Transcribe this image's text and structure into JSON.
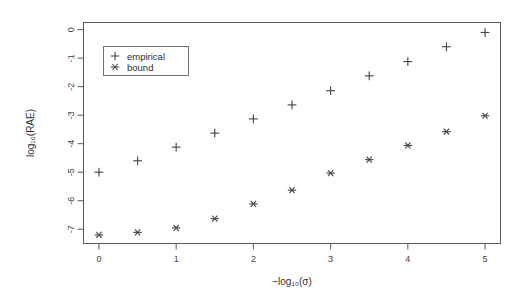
{
  "chart_data": {
    "type": "scatter",
    "title": "",
    "xlabel": "−log₁₀(σ)",
    "ylabel": "log₁₀(RAE)",
    "xlim": [
      -0.2,
      5.2
    ],
    "ylim": [
      -7.5,
      0.25
    ],
    "xticks": [
      0,
      1,
      2,
      3,
      4,
      5
    ],
    "xticklabels": [
      "0",
      "1",
      "2",
      "3",
      "4",
      "5"
    ],
    "yticks": [
      0,
      -1,
      -2,
      -3,
      -4,
      -5,
      -6,
      -7
    ],
    "yticklabels": [
      "0",
      "-1",
      "-2",
      "-3",
      "-4",
      "-5",
      "-6",
      "-7"
    ],
    "grid": false,
    "legend_position": "top-left",
    "x": [
      0,
      0.5,
      1,
      1.5,
      2,
      2.5,
      3,
      3.5,
      4,
      4.5,
      5
    ],
    "series": [
      {
        "name": "empirical",
        "marker": "plus",
        "values": [
          -5.0,
          -4.6,
          -4.12,
          -3.63,
          -3.13,
          -2.64,
          -2.14,
          -1.62,
          -1.12,
          -0.6,
          -0.1
        ]
      },
      {
        "name": "bound",
        "marker": "asterisk",
        "values": [
          -7.2,
          -7.11,
          -6.95,
          -6.63,
          -6.11,
          -5.63,
          -5.03,
          -4.56,
          -4.06,
          -3.58,
          -3.02
        ]
      }
    ]
  },
  "legend": {
    "entries": [
      {
        "label": "empirical",
        "marker": "plus-icon"
      },
      {
        "label": "bound",
        "marker": "asterisk-icon"
      }
    ]
  }
}
